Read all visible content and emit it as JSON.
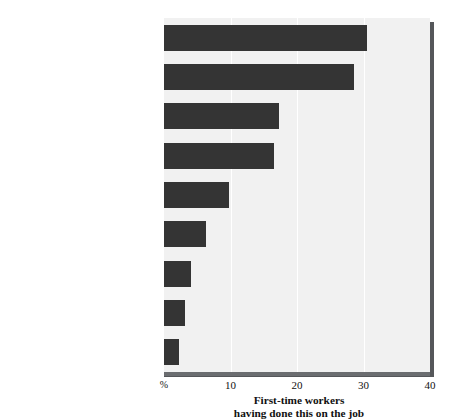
{
  "chart_data": {
    "type": "bar",
    "orientation": "horizontal",
    "title": "",
    "subtitle": "",
    "xlabel": "First-time workers\nhaving done this on the job",
    "ylabel": "",
    "xlim": [
      0,
      40
    ],
    "xticks": [
      0,
      10,
      20,
      30,
      40
    ],
    "xtick_labels": [
      "%",
      "10",
      "20",
      "30",
      "40"
    ],
    "grid": true,
    "grid_axis": "x",
    "legend": false,
    "legend_position": "none",
    "units": "percent",
    "categories": [
      "Called in sick when not",
      "Gave away things free\nor for less than value",
      "Took things from\nemployer or co-workers",
      "Worked while drunk\nor high",
      "Put more hours on\ntimecard than was true",
      "Lied to employer\nto get or keep job",
      "Took money from work",
      "Purposely short-changed\na customer",
      "Purposely damaged\nemployer's property"
    ],
    "values": [
      30.5,
      28.5,
      17.3,
      16.5,
      9.7,
      6.3,
      4.0,
      3.2,
      2.2
    ],
    "colors": {
      "bar": "#343434",
      "plot_background": "#f1f1f1",
      "gridline": "#ffffff",
      "axis": "#55575a",
      "text": "#111111",
      "page_background": "#ffffff"
    }
  },
  "axis": {
    "caption": "First-time workers\nhaving done this on the job",
    "ticks": [
      {
        "label": "%",
        "value": 0
      },
      {
        "label": "10",
        "value": 10
      },
      {
        "label": "20",
        "value": 20
      },
      {
        "label": "30",
        "value": 30
      },
      {
        "label": "40",
        "value": 40
      }
    ]
  }
}
